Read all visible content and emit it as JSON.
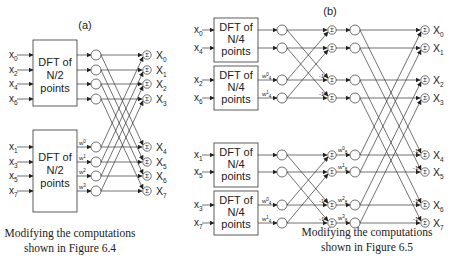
{
  "panel_a": {
    "title": "(a)",
    "box_lines": [
      "DFT of",
      "N/2",
      "points"
    ],
    "top_inputs": [
      "x",
      "x",
      "x",
      "x"
    ],
    "top_input_subs": [
      "0",
      "2",
      "4",
      "6"
    ],
    "bottom_inputs": [
      "x",
      "x",
      "x",
      "x"
    ],
    "bottom_input_subs": [
      "1",
      "3",
      "5",
      "7"
    ],
    "weights": [
      "w",
      "w",
      "w",
      "w"
    ],
    "weight_sups": [
      "0",
      "1",
      "2",
      "3"
    ],
    "outputs": [
      "X",
      "X",
      "X",
      "X",
      "X",
      "X",
      "X",
      "X"
    ],
    "output_subs": [
      "0",
      "1",
      "2",
      "3",
      "4",
      "5",
      "6",
      "7"
    ],
    "sum_symbol": "Σ",
    "caption_lines": [
      "Modifying the computations",
      "shown in Figure 6.4"
    ]
  },
  "panel_b": {
    "title": "(b)",
    "box_lines": [
      "DFT of",
      "N/4",
      "points"
    ],
    "inputs": [
      "x",
      "x",
      "x",
      "x",
      "x",
      "x",
      "x",
      "x"
    ],
    "input_subs": [
      "0",
      "4",
      "2",
      "6",
      "1",
      "5",
      "3",
      "7"
    ],
    "stage1_weight": "w",
    "stage1_weight_sub": "4",
    "stage1_weight_sups": [
      "0",
      "1"
    ],
    "stage2_weight": "w",
    "stage2_weight_sub": "8",
    "stage2_weight_sups": [
      "0",
      "1",
      "2",
      "3"
    ],
    "neg_label": "-1",
    "outputs": [
      "X",
      "X",
      "X",
      "X",
      "X",
      "X",
      "X",
      "X"
    ],
    "output_subs": [
      "0",
      "1",
      "2",
      "3",
      "4",
      "5",
      "6",
      "7"
    ],
    "sum_symbol": "Σ",
    "caption_lines": [
      "Modifying the computations",
      "shown in Figure 6.5"
    ]
  }
}
